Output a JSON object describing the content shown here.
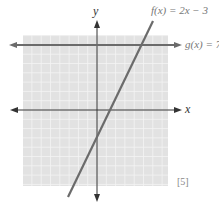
{
  "chart_data": {
    "type": "line",
    "title": "",
    "xlabel": "x",
    "ylabel": "y",
    "xlim": [
      -8,
      8
    ],
    "ylim": [
      -8,
      8
    ],
    "grid": true,
    "series": [
      {
        "name": "f(x) = 2x − 3",
        "label": "f(x) = 2x − 3",
        "slope": 2,
        "intercept": -3,
        "x": [
          -2.7,
          5
        ],
        "y": [
          -8.4,
          7
        ]
      },
      {
        "name": "g(x) = 7",
        "label": "g(x) = 7",
        "slope": 0,
        "intercept": 7,
        "x": [
          -8,
          8
        ],
        "y": [
          7,
          7
        ]
      }
    ],
    "annotations": [
      "[5]"
    ]
  },
  "labels": {
    "f": "f(x) = 2x − 3",
    "g": "g(x) = 7",
    "x_axis": "x",
    "y_axis": "y",
    "mark": "[5]"
  },
  "colors": {
    "grid_bg": "#e2e2e2",
    "grid_line": "#f4f4f4",
    "axis": "#333333",
    "series": "#6b6b6b"
  }
}
